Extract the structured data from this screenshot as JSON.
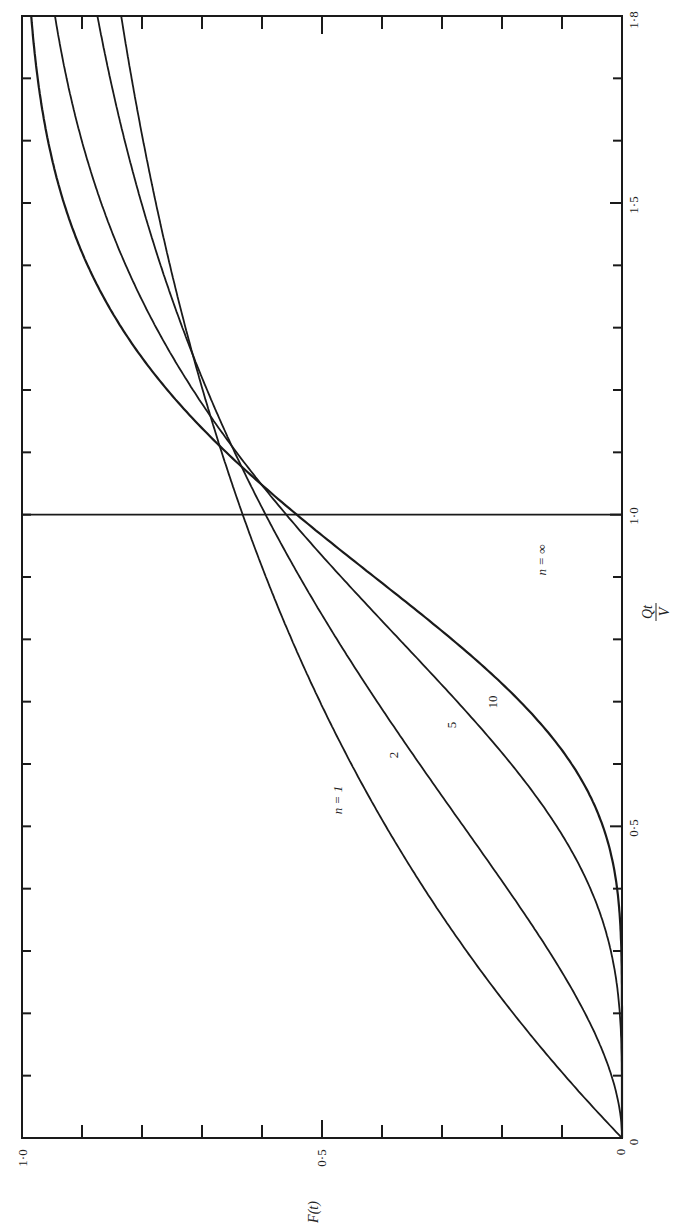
{
  "chart_data": {
    "type": "line",
    "title": "",
    "orientation": "rotated 90° counter-clockwise (F(t) runs horizontally along bottom, Qt/V runs vertically along right side)",
    "xlabel": "Qt/V",
    "ylabel": "F(t)",
    "xlim": [
      0,
      1.8
    ],
    "ylim": [
      0,
      1.0
    ],
    "x_ticks": [
      0,
      0.1,
      0.2,
      0.3,
      0.4,
      0.5,
      0.6,
      0.7,
      0.8,
      0.9,
      1.0,
      1.1,
      1.2,
      1.3,
      1.4,
      1.5,
      1.6,
      1.7,
      1.8
    ],
    "x_tick_labels": [
      "0",
      "0·5",
      "1·0",
      "1·5",
      "1·8"
    ],
    "y_ticks": [
      0,
      0.1,
      0.2,
      0.3,
      0.4,
      0.5,
      0.6,
      0.7,
      0.8,
      0.9,
      1.0
    ],
    "y_tick_labels": [
      "0",
      "0·5",
      "1·0"
    ],
    "grid": false,
    "legend": "inline curve labels",
    "x": [
      0,
      0.1,
      0.2,
      0.3,
      0.4,
      0.5,
      0.6,
      0.7,
      0.8,
      0.9,
      1.0,
      1.1,
      1.2,
      1.3,
      1.4,
      1.5,
      1.6,
      1.7,
      1.8
    ],
    "series": [
      {
        "name": "n = 1",
        "label": "n = 1",
        "values": [
          0,
          0.1,
          0.18,
          0.26,
          0.33,
          0.39,
          0.45,
          0.5,
          0.55,
          0.59,
          0.63,
          0.67,
          0.7,
          0.73,
          0.75,
          0.78,
          0.8,
          0.82,
          0.83
        ]
      },
      {
        "name": "n = 2",
        "label": "2",
        "values": [
          0,
          0.02,
          0.06,
          0.12,
          0.19,
          0.26,
          0.34,
          0.41,
          0.47,
          0.54,
          0.59,
          0.65,
          0.69,
          0.73,
          0.77,
          0.8,
          0.83,
          0.85,
          0.87
        ]
      },
      {
        "name": "n = 5",
        "label": "5",
        "values": [
          0,
          0.0,
          0.02,
          0.07,
          0.14,
          0.24,
          0.35,
          0.46,
          0.55,
          0.63,
          0.7,
          0.76,
          0.81,
          0.85,
          0.88,
          0.91,
          0.93,
          0.95,
          0.96
        ]
      },
      {
        "name": "n = 10",
        "label": "10",
        "values": [
          0,
          0.0,
          0.0,
          0.01,
          0.04,
          0.13,
          0.27,
          0.42,
          0.58,
          0.71,
          0.8,
          0.86,
          0.9,
          0.93,
          0.95,
          0.97,
          0.98,
          0.99,
          0.99
        ]
      },
      {
        "name": "n = ∞",
        "label": "n = ∞",
        "values": [
          0,
          0,
          0,
          0,
          0,
          0,
          0,
          0,
          0,
          0,
          1.0,
          1.0,
          1.0,
          1.0,
          1.0,
          1.0,
          1.0,
          1.0,
          1.0
        ]
      }
    ],
    "annotations": [
      "n = 1",
      "2",
      "5",
      "10",
      "n = ∞"
    ]
  },
  "labels": {
    "x_axis_title_num": "Qt",
    "x_axis_title_den": "V",
    "y_axis_title": "F(t)",
    "x_tick_0": "0",
    "x_tick_05": "0·5",
    "x_tick_10": "1·0",
    "x_tick_15": "1·5",
    "x_tick_18": "1·8",
    "y_tick_0": "0",
    "y_tick_05": "0·5",
    "y_tick_10": "1·0",
    "curve_n1": "n = 1",
    "curve_n2": "2",
    "curve_n5": "5",
    "curve_n10": "10",
    "curve_ninf": "n = ∞"
  },
  "style": {
    "line_color": "#1a1a1a",
    "background": "#ffffff"
  }
}
